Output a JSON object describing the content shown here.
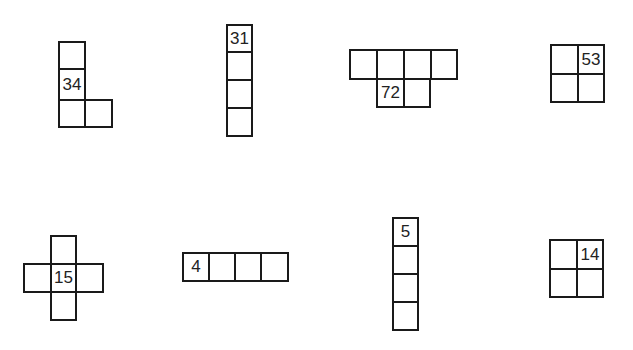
{
  "shapes": [
    {
      "id": "shape-1",
      "label": "34",
      "cells": [
        {
          "x": 58,
          "y": 41,
          "w": 28,
          "h": 29
        },
        {
          "x": 58,
          "y": 68,
          "w": 28,
          "h": 33,
          "text": "34"
        },
        {
          "x": 58,
          "y": 99,
          "w": 28,
          "h": 29
        },
        {
          "x": 84,
          "y": 99,
          "w": 29,
          "h": 29
        }
      ]
    },
    {
      "id": "shape-2",
      "label": "31",
      "cells": [
        {
          "x": 226,
          "y": 24,
          "w": 27,
          "h": 29,
          "text": "31"
        },
        {
          "x": 226,
          "y": 51,
          "w": 27,
          "h": 30
        },
        {
          "x": 226,
          "y": 79,
          "w": 27,
          "h": 30
        },
        {
          "x": 226,
          "y": 107,
          "w": 27,
          "h": 30
        }
      ]
    },
    {
      "id": "shape-3",
      "label": "72",
      "cells": [
        {
          "x": 349,
          "y": 49,
          "w": 29,
          "h": 31
        },
        {
          "x": 376,
          "y": 49,
          "w": 29,
          "h": 31
        },
        {
          "x": 403,
          "y": 49,
          "w": 29,
          "h": 31
        },
        {
          "x": 430,
          "y": 49,
          "w": 28,
          "h": 31
        },
        {
          "x": 376,
          "y": 78,
          "w": 29,
          "h": 30,
          "text": "72"
        },
        {
          "x": 403,
          "y": 78,
          "w": 28,
          "h": 30
        }
      ]
    },
    {
      "id": "shape-4",
      "label": "53",
      "cells": [
        {
          "x": 550,
          "y": 44,
          "w": 29,
          "h": 31
        },
        {
          "x": 577,
          "y": 44,
          "w": 28,
          "h": 31,
          "text": "53"
        },
        {
          "x": 550,
          "y": 73,
          "w": 29,
          "h": 30
        },
        {
          "x": 577,
          "y": 73,
          "w": 28,
          "h": 30
        }
      ]
    },
    {
      "id": "shape-5",
      "label": "15",
      "cells": [
        {
          "x": 50,
          "y": 235,
          "w": 27,
          "h": 30
        },
        {
          "x": 23,
          "y": 263,
          "w": 29,
          "h": 30
        },
        {
          "x": 50,
          "y": 263,
          "w": 27,
          "h": 30,
          "text": "15"
        },
        {
          "x": 75,
          "y": 263,
          "w": 29,
          "h": 30
        },
        {
          "x": 50,
          "y": 291,
          "w": 27,
          "h": 30
        }
      ]
    },
    {
      "id": "shape-6",
      "label": "4",
      "cells": [
        {
          "x": 182,
          "y": 252,
          "w": 28,
          "h": 30,
          "text": "4"
        },
        {
          "x": 208,
          "y": 252,
          "w": 28,
          "h": 30
        },
        {
          "x": 234,
          "y": 252,
          "w": 28,
          "h": 30
        },
        {
          "x": 260,
          "y": 252,
          "w": 29,
          "h": 30
        }
      ]
    },
    {
      "id": "shape-7",
      "label": "5",
      "cells": [
        {
          "x": 392,
          "y": 217,
          "w": 27,
          "h": 30,
          "text": "5"
        },
        {
          "x": 392,
          "y": 245,
          "w": 27,
          "h": 30
        },
        {
          "x": 392,
          "y": 273,
          "w": 27,
          "h": 30
        },
        {
          "x": 392,
          "y": 301,
          "w": 27,
          "h": 30
        }
      ]
    },
    {
      "id": "shape-8",
      "label": "14",
      "cells": [
        {
          "x": 549,
          "y": 239,
          "w": 29,
          "h": 31
        },
        {
          "x": 576,
          "y": 239,
          "w": 28,
          "h": 31,
          "text": "14"
        },
        {
          "x": 549,
          "y": 268,
          "w": 29,
          "h": 30
        },
        {
          "x": 576,
          "y": 268,
          "w": 28,
          "h": 30
        }
      ]
    }
  ]
}
